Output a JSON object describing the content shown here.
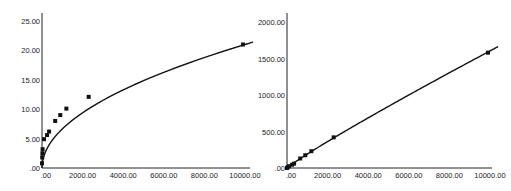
{
  "chart_data": [
    {
      "type": "scatter",
      "title": "",
      "xlabel": "",
      "ylabel": "",
      "xlim": [
        0,
        10500
      ],
      "ylim": [
        0,
        26
      ],
      "grid": false,
      "legend": null,
      "x_ticks": [
        ".00",
        "2000.00",
        "4000.00",
        "6000.00",
        "8000.00",
        "10000.00"
      ],
      "y_ticks": [
        ".00",
        "5.00",
        "10.00",
        "15.00",
        "20.00",
        "25.00"
      ],
      "points": [
        {
          "x": 0,
          "y": 0.8
        },
        {
          "x": 10,
          "y": 1.8
        },
        {
          "x": 20,
          "y": 2.5
        },
        {
          "x": 30,
          "y": 3.2
        },
        {
          "x": 100,
          "y": 4.9
        },
        {
          "x": 250,
          "y": 5.6
        },
        {
          "x": 350,
          "y": 6.2
        },
        {
          "x": 650,
          "y": 8.0
        },
        {
          "x": 900,
          "y": 9.0
        },
        {
          "x": 1200,
          "y": 10.1
        },
        {
          "x": 2300,
          "y": 12.1
        },
        {
          "x": 9900,
          "y": 21.0
        }
      ],
      "fit_curve": {
        "type": "power",
        "equation": "y = 0.21 * x^0.5",
        "color": "#111111"
      }
    },
    {
      "type": "scatter",
      "title": "",
      "xlabel": "",
      "ylabel": "",
      "xlim": [
        0,
        10500
      ],
      "ylim": [
        0,
        2100
      ],
      "grid": false,
      "legend": null,
      "x_ticks": [
        ".00",
        "2000.00",
        "4000.00",
        "6000.00",
        "8000.00",
        "10000.00"
      ],
      "y_ticks": [
        ".00",
        "500.00",
        "1000.00",
        "1500.00",
        "2000.00"
      ],
      "points": [
        {
          "x": 0,
          "y": 0
        },
        {
          "x": 30,
          "y": 10
        },
        {
          "x": 100,
          "y": 25
        },
        {
          "x": 250,
          "y": 45
        },
        {
          "x": 350,
          "y": 60
        },
        {
          "x": 650,
          "y": 130
        },
        {
          "x": 900,
          "y": 175
        },
        {
          "x": 1200,
          "y": 230
        },
        {
          "x": 2300,
          "y": 420
        },
        {
          "x": 9900,
          "y": 1580
        }
      ],
      "fit_curve": {
        "type": "power",
        "equation": "y = 0.32 * x^0.925",
        "color": "#111111"
      }
    }
  ]
}
